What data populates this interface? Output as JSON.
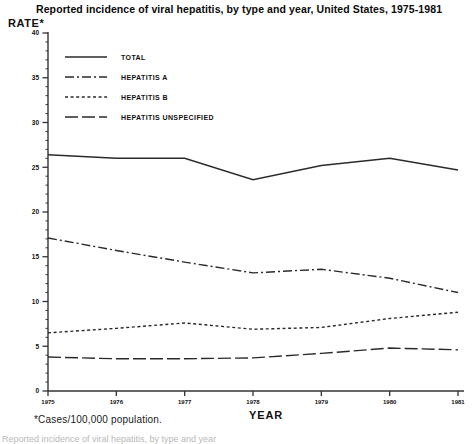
{
  "title": "Reported incidence of viral hepatitis, by type and year, United States, 1975-1981",
  "axis": {
    "y_title": "RATE*",
    "x_title": "YEAR"
  },
  "footnote": "*Cases/100,000 population.",
  "caption_clipped": "Reported incidence of viral hepatitis, by type and year",
  "colors": {
    "line": "#2a2a2a",
    "axis": "#333333",
    "text": "#111111",
    "background": "#ffffff"
  },
  "legend": {
    "entries": [
      {
        "label": "TOTAL",
        "style": "solid"
      },
      {
        "label": "HEPATITIS A",
        "style": "dash-dot"
      },
      {
        "label": "HEPATITIS B",
        "style": "dotted"
      },
      {
        "label": "HEPATITIS UNSPECIFIED",
        "style": "long-dash"
      }
    ]
  },
  "chart_data": {
    "type": "line",
    "title": "Reported incidence of viral hepatitis, by type and year, United States, 1975-1981",
    "xlabel": "YEAR",
    "ylabel": "RATE*",
    "ylim": [
      0,
      40
    ],
    "xlim": [
      1975,
      1981
    ],
    "ytick_labels": [
      "0",
      "5",
      "10",
      "15",
      "20",
      "25",
      "30",
      "35",
      "40"
    ],
    "yticks": [
      0,
      5,
      10,
      15,
      20,
      25,
      30,
      35,
      40
    ],
    "y_minor_tick_step": 1,
    "grid": false,
    "legend_position": "upper-left inside plot",
    "categories": [
      1975,
      1976,
      1977,
      1978,
      1979,
      1980,
      1981
    ],
    "xtick_labels": [
      "1975",
      "1976",
      "1977",
      "1978",
      "1979",
      "1980",
      "1981"
    ],
    "series": [
      {
        "name": "TOTAL",
        "style": "solid",
        "values": [
          26.4,
          26.0,
          26.0,
          23.6,
          25.2,
          26.0,
          24.7
        ]
      },
      {
        "name": "HEPATITIS A",
        "style": "dash-dot",
        "values": [
          17.1,
          15.7,
          14.4,
          13.2,
          13.6,
          12.6,
          11.0
        ]
      },
      {
        "name": "HEPATITIS B",
        "style": "dotted",
        "values": [
          6.5,
          7.0,
          7.6,
          6.9,
          7.1,
          8.1,
          8.8
        ]
      },
      {
        "name": "HEPATITIS UNSPECIFIED",
        "style": "long-dash",
        "values": [
          3.8,
          3.6,
          3.6,
          3.7,
          4.2,
          4.8,
          4.6
        ]
      }
    ]
  }
}
